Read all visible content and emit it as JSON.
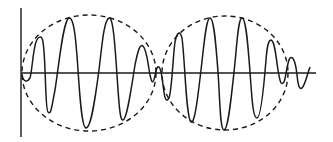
{
  "diagram": {
    "type": "wave-envelope",
    "colors": {
      "background": "#ffffff",
      "stroke": "#1a1a1a"
    },
    "axes": {
      "vertical": {
        "x": 21,
        "y1": 8,
        "y2": 137
      },
      "horizontal": {
        "y": 73,
        "x1": 21,
        "x2": 316
      }
    },
    "envelopes": [
      {
        "name": "left-envelope",
        "cx": 89,
        "cy": 73,
        "rx": 67,
        "ry": 58,
        "style": "dashed"
      },
      {
        "name": "right-envelope",
        "cx": 225,
        "cy": 73,
        "rx": 63,
        "ry": 57,
        "style": "dashed"
      }
    ]
  }
}
